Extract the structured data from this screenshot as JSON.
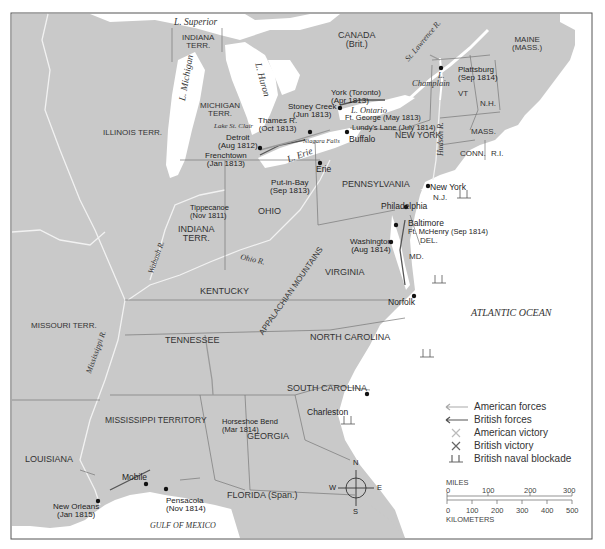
{
  "map": {
    "title": "War of 1812",
    "colors": {
      "land": "#c9c9c9",
      "water": "#ffffff",
      "border": "#777777",
      "river": "#f4f4f4",
      "forces_american": "#9a9a9a",
      "forces_british": "#555555"
    },
    "water_bodies": {
      "superior": "L. Superior",
      "michigan": "L. Michigan",
      "huron": "L. Huron",
      "erie": "L. Erie",
      "ontario": "L. Ontario",
      "st_clair": "Lake St. Clair",
      "champlain_1": "L.",
      "champlain_2": "Champlain",
      "atlantic": "ATLANTIC OCEAN",
      "gulf": "GULF OF MEXICO"
    },
    "rivers": {
      "st_lawrence": "St. Lawrence R.",
      "hudson": "Hudson R.",
      "ohio": "Ohio R.",
      "wabash": "Wabash R.",
      "mississippi": "Mississippi R.",
      "niagara": "Niagara Falls"
    },
    "regions": {
      "canada_1": "CANADA",
      "canada_2": "(Brit.)",
      "indiana_terr_n_1": "INDIANA",
      "indiana_terr_n_2": "TERR.",
      "michigan_1": "MICHIGAN",
      "michigan_2": "TERR.",
      "illinois": "ILLINOIS TERR.",
      "maine_1": "MAINE",
      "maine_2": "(MASS.)",
      "vt": "VT",
      "nh": "N.H.",
      "mass": "MASS.",
      "conn": "CONN.",
      "ri": "R.I.",
      "new_york": "NEW YORK",
      "nj": "N.J.",
      "pennsylvania": "PENNSYLVANIA",
      "del": "DEL.",
      "md": "MD.",
      "ohio": "OHIO",
      "indiana_1": "INDIANA",
      "indiana_2": "TERR.",
      "virginia": "VIRGINIA",
      "kentucky": "KENTUCKY",
      "missouri": "MISSOURI TERR.",
      "tennessee": "TENNESSEE",
      "north_carolina": "NORTH CAROLINA",
      "south_carolina": "SOUTH CAROLINA",
      "mississippi": "MISSISSIPPI TERRITORY",
      "georgia": "GEORGIA",
      "louisiana": "LOUISIANA",
      "florida": "FLORIDA (Span.)",
      "appalachian": "APPALACHIAN MOUNTAINS"
    },
    "places": {
      "plattsburg_1": "Plattsburg",
      "plattsburg_2": "(Sep 1814)",
      "york_1": "York (Toronto)",
      "york_2": "(Apr 1813)",
      "stoney_1": "Stoney Creek",
      "stoney_2": "(Jun 1813)",
      "ft_george": "Ft. George (May 1813)",
      "lundys": "Lundy's Lane (July 1814)",
      "buffalo": "Buffalo",
      "thames_1": "Thames R.",
      "thames_2": "(Oct 1813)",
      "detroit_1": "Detroit",
      "detroit_2": "(Aug 1812)",
      "frenchtown_1": "Frenchtown",
      "frenchtown_2": "(Jan 1813)",
      "erie": "Erie",
      "put_in_bay_1": "Put-in-Bay",
      "put_in_bay_2": "(Sep 1813)",
      "new_york": "New York",
      "philadelphia": "Philadelphia",
      "baltimore": "Baltimore",
      "ft_mchenry": "Ft. McHenry (Sep 1814)",
      "washington_1": "Washington",
      "washington_2": "(Aug 1814)",
      "tippecanoe_1": "Tippecanoe",
      "tippecanoe_2": "(Nov 1811)",
      "norfolk": "Norfolk",
      "charleston": "Charleston",
      "horseshoe_1": "Horseshoe Bend",
      "horseshoe_2": "(Mar 1814)",
      "mobile": "Mobile",
      "pensacola_1": "Pensacola",
      "pensacola_2": "(Nov 1814)",
      "new_orleans_1": "New Orleans",
      "new_orleans_2": "(Jan 1815)"
    }
  },
  "legend": {
    "items": [
      {
        "icon": "arrow-light-icon",
        "label": "American forces"
      },
      {
        "icon": "arrow-dark-icon",
        "label": "British forces"
      },
      {
        "icon": "crossed-swords-light-icon",
        "label": "American victory"
      },
      {
        "icon": "crossed-swords-dark-icon",
        "label": "British victory"
      },
      {
        "icon": "ship-icon",
        "label": "British naval blockade"
      }
    ]
  },
  "compass": {
    "n": "N",
    "s": "S",
    "e": "E",
    "w": "W"
  },
  "scale": {
    "miles_label": "MILES",
    "miles_ticks": [
      "0",
      "100",
      "200",
      "300"
    ],
    "km_label": "KILOMETERS",
    "km_ticks": [
      "0",
      "100",
      "200",
      "300",
      "400",
      "500"
    ]
  }
}
